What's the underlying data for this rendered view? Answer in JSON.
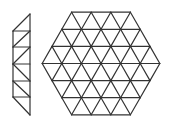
{
  "figure": {
    "stroke_color": "#333333",
    "background": "#ffffff"
  },
  "strip": {
    "x_left": 13,
    "x_right": 30,
    "top": 14,
    "bottom": 115,
    "rungs": [
      31,
      47,
      64,
      81,
      97
    ],
    "diagonals": [
      [
        13,
        31,
        30,
        14
      ],
      [
        13,
        47,
        30,
        31
      ],
      [
        13,
        64,
        30,
        47
      ],
      [
        13,
        64,
        30,
        81
      ],
      [
        13,
        81,
        30,
        97
      ],
      [
        13,
        97,
        30,
        115
      ]
    ]
  },
  "hexagon": {
    "side_units": 3,
    "unit_width": 19.6,
    "row_height": 17.1,
    "center_x": 101,
    "center_y": 63.5
  }
}
